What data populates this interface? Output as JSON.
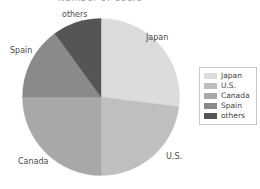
{
  "chart_data": {
    "type": "pie",
    "title": "Number of Users",
    "categories": [
      "Japan",
      "U.S.",
      "Canada",
      "Spain",
      "others"
    ],
    "values": [
      27,
      23,
      25,
      15,
      10
    ],
    "units": "percent",
    "start_angle_deg": 0,
    "direction": "clockwise",
    "colors": [
      "#dcdcdc",
      "#bfbfbf",
      "#a8a8a8",
      "#8a8a8a",
      "#555555"
    ],
    "legend": {
      "position": "right",
      "entries": [
        {
          "label": "Japan",
          "color": "#dcdcdc"
        },
        {
          "label": "U.S.",
          "color": "#bfbfbf"
        },
        {
          "label": "Canada",
          "color": "#a8a8a8"
        },
        {
          "label": "Spain",
          "color": "#8a8a8a"
        },
        {
          "label": "others",
          "color": "#555555"
        }
      ]
    },
    "slice_labels": [
      {
        "label": "Japan",
        "position": "upper-right"
      },
      {
        "label": "U.S.",
        "position": "lower-right"
      },
      {
        "label": "Canada",
        "position": "lower-left"
      },
      {
        "label": "Spain",
        "position": "upper-left"
      },
      {
        "label": "others",
        "position": "top"
      }
    ],
    "xlabel": "",
    "ylabel": "",
    "grid": false
  },
  "slice_labels": {
    "japan": "Japan",
    "us": "U.S.",
    "canada": "Canada",
    "spain": "Spain",
    "others": "others"
  },
  "legend": {
    "items": [
      {
        "label": "Japan"
      },
      {
        "label": "U.S."
      },
      {
        "label": "Canada"
      },
      {
        "label": "Spain"
      },
      {
        "label": "others"
      }
    ]
  },
  "title": "Number of Users"
}
